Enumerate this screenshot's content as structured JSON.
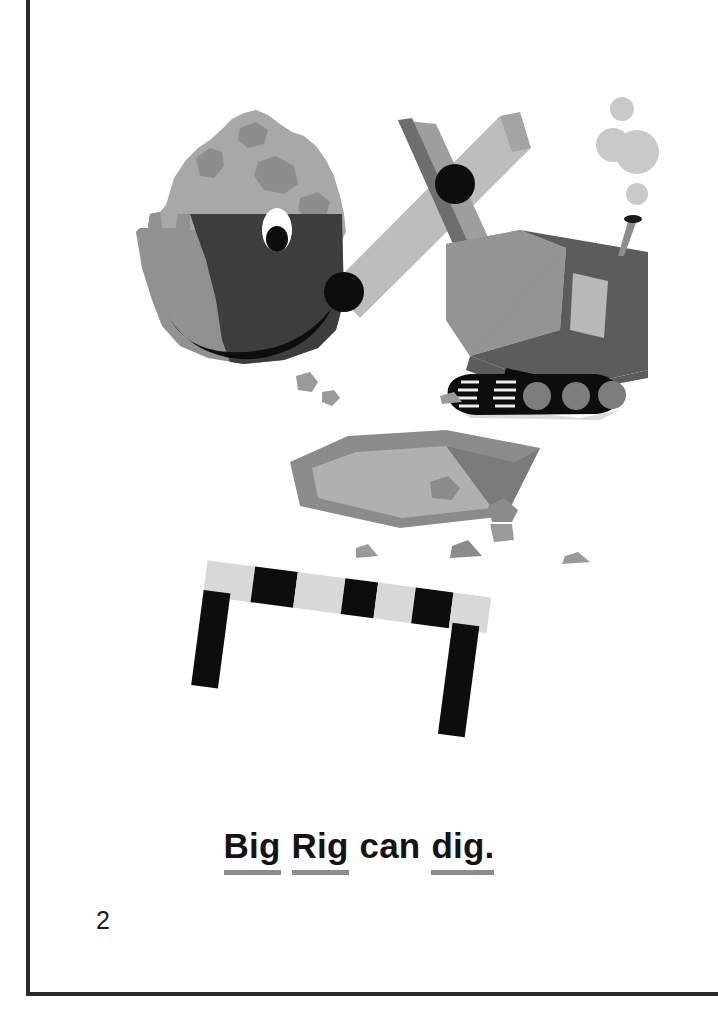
{
  "page": {
    "number": "2",
    "background_color": "#ffffff",
    "border_color": "#2b2b2b"
  },
  "sentence": {
    "full_text": "Big Rig can dig.",
    "words": [
      {
        "text": "Big",
        "underlined": true
      },
      {
        "text": "Rig",
        "underlined": true
      },
      {
        "text": "can",
        "underlined": false
      },
      {
        "text": "dig.",
        "underlined": true
      }
    ],
    "underline_color": "#8c8c8c",
    "text_color": "#141414"
  },
  "illustration": {
    "title": "Big Rig the excavator digging a hole",
    "alt_text": "A cartoon excavator with a smiling bucket face lifts a pile of dirt beside a dug pit, with a striped construction barricade in front.",
    "palette": {
      "dirt_light": "#a8a8a8",
      "dirt_dark": "#8d8d8d",
      "bucket_light": "#919191",
      "bucket_dark": "#3d3d3d",
      "arm_light": "#bdbdbd",
      "arm_shadow": "#6e6e6e",
      "body_light": "#949494",
      "body_dark": "#5c5c5c",
      "window": "#b8b8b8",
      "track_black": "#0d0d0d",
      "wheel_gray": "#7d7d7d",
      "smoke": "#c9c9c9",
      "pit_floor": "#b0b0b0",
      "pit_rim": "#8b8b8b",
      "pit_shadow": "#7a7a7a",
      "rock": "#9a9a9a",
      "barricade_light": "#d8d8d8",
      "barricade_dark": "#0d0d0d",
      "ground_shadow": "#d7d7d7",
      "eye_white": "#ffffff",
      "eye_pupil": "#0d0d0d",
      "smile": "#0d0d0d",
      "pivot": "#0d0d0d"
    },
    "elements": [
      {
        "name": "dirt-pile",
        "label": "pile of dirt"
      },
      {
        "name": "excavator-bucket",
        "label": "smiling bucket"
      },
      {
        "name": "bucket-eye",
        "label": "eye"
      },
      {
        "name": "bucket-smile",
        "label": "smile"
      },
      {
        "name": "excavator-boom-arm",
        "label": "boom arm"
      },
      {
        "name": "excavator-dipper-arm",
        "label": "dipper arm"
      },
      {
        "name": "arm-pivot",
        "label": "pivot joint"
      },
      {
        "name": "excavator-body",
        "label": "cab body"
      },
      {
        "name": "cab-window",
        "label": "cab window"
      },
      {
        "name": "exhaust-pipe",
        "label": "exhaust pipe"
      },
      {
        "name": "smoke-puffs",
        "label": "smoke puffs"
      },
      {
        "name": "excavator-track",
        "label": "crawler track"
      },
      {
        "name": "dug-pit",
        "label": "dug hole"
      },
      {
        "name": "scattered-rocks",
        "label": "rocks"
      },
      {
        "name": "construction-barricade",
        "label": "striped barricade"
      }
    ]
  }
}
